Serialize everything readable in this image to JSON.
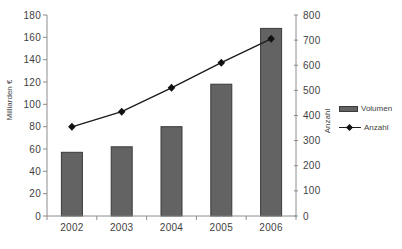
{
  "chart_data": {
    "type": "bar+line",
    "title": "",
    "categories": [
      "2002",
      "2003",
      "2004",
      "2005",
      "2006"
    ],
    "series": [
      {
        "name": "Volumen",
        "type": "bar",
        "axis": "left",
        "values": [
          57,
          62,
          80,
          118,
          168
        ]
      },
      {
        "name": "Anzahl",
        "type": "line",
        "axis": "right",
        "marker": "diamond",
        "values": [
          355,
          415,
          510,
          610,
          705
        ]
      }
    ],
    "ylabel_left": "Milliarden €",
    "ylabel_right": "Anzahl",
    "xlabel": "",
    "axis_left": {
      "min": 0,
      "max": 180,
      "step": 20,
      "ticks": [
        0,
        20,
        40,
        60,
        80,
        100,
        120,
        140,
        160,
        180
      ]
    },
    "axis_right": {
      "min": 0,
      "max": 800,
      "step": 100,
      "ticks": [
        0,
        100,
        200,
        300,
        400,
        500,
        600,
        700,
        800
      ]
    },
    "grid": false,
    "legend_position": "right"
  },
  "colors": {
    "background": "#ffffff",
    "bar_fill": "#636363",
    "bar_border": "#3a3a3a",
    "line": "#1c1c1c",
    "marker": "#111111",
    "axis": "#8c8c8c",
    "text": "#3f3f3f"
  }
}
